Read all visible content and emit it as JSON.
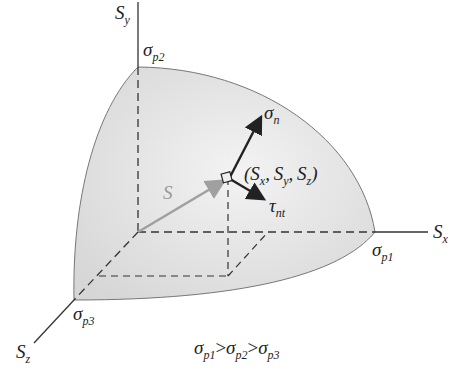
{
  "diagram": {
    "type": "stress-ellipsoid-octant",
    "axes": {
      "x": {
        "label": "S",
        "sub": "x"
      },
      "y": {
        "label": "S",
        "sub": "y"
      },
      "z": {
        "label": "S",
        "sub": "z"
      }
    },
    "principal_points": {
      "p1": {
        "label": "σ",
        "sub": "p1"
      },
      "p2": {
        "label": "σ",
        "sub": "p2"
      },
      "p3": {
        "label": "σ",
        "sub": "p3"
      }
    },
    "vectors": {
      "S": {
        "label": "S"
      },
      "normal": {
        "label": "σ",
        "sub": "n"
      },
      "shear": {
        "label": "τ",
        "sub": "nt"
      }
    },
    "point_label": {
      "open": "(",
      "sx": "S",
      "sx_sub": "x",
      "sy": "S",
      "sy_sub": "y",
      "sz": "S",
      "sz_sub": "z",
      "sep": ",",
      "close": ")"
    },
    "inequality": {
      "a": "σ",
      "a_sub": "p1",
      "gt": ">",
      "b": "σ",
      "b_sub": "p2",
      "c": "σ",
      "c_sub": "p3"
    },
    "colors": {
      "surface": "#e4e4e4",
      "edge": "#777777",
      "axis": "#333333",
      "s_vector": "#a0a0a0",
      "vector": "#222222"
    }
  }
}
